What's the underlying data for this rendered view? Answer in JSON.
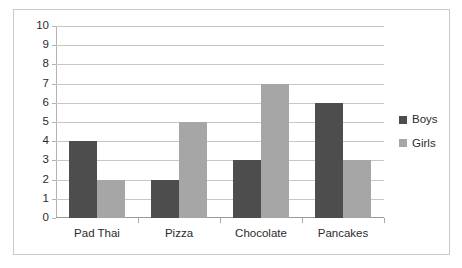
{
  "chart_data": {
    "type": "bar",
    "title": "",
    "subtitle": "",
    "xlabel": "",
    "ylabel": "",
    "categories": [
      "Pad Thai",
      "Pizza",
      "Chocolate",
      "Pancakes"
    ],
    "series": [
      {
        "name": "Boys",
        "values": [
          4,
          2,
          3,
          6
        ],
        "color": "#4d4d4d"
      },
      {
        "name": "Girls",
        "values": [
          2,
          5,
          7,
          3
        ],
        "color": "#a6a6a6"
      }
    ],
    "ylim": [
      0,
      10
    ],
    "ytick_interval": 1,
    "yticks": [
      "10",
      "9",
      "8",
      "7",
      "6",
      "5",
      "4",
      "3",
      "2",
      "1",
      "0"
    ],
    "grid": true,
    "grid_axis": "y",
    "legend_position": "right",
    "legend": [
      "Boys",
      "Girls"
    ],
    "annotations": []
  },
  "frame": {
    "border_color": "#c9c9c9",
    "background": "#ffffff"
  },
  "axes": {
    "gridline_color": "#c8c8c8",
    "axis_line_color": "#b3b3b3",
    "tick_color": "#a8a8a8",
    "label_color": "#2b2b2b"
  }
}
